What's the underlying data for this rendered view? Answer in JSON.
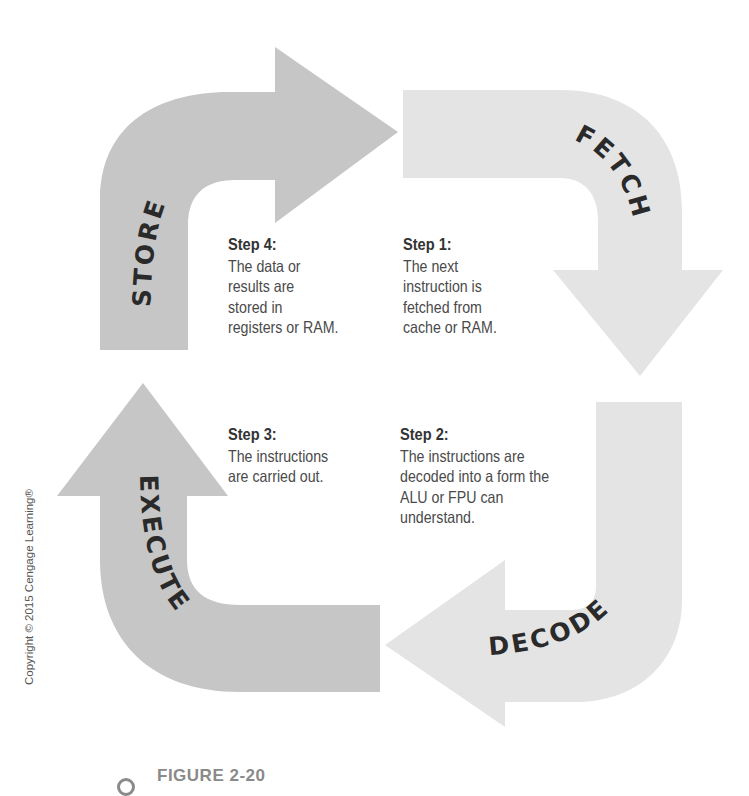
{
  "figure": {
    "caption": "FIGURE 2-20",
    "copyright": "Copyright © 2015 Cengage Learning®",
    "colors": {
      "dark_arrow": "#c6c6c6",
      "light_arrow": "#e4e4e4",
      "label_text": "#2a2a2a",
      "body_text": "#4a4a4a",
      "caption_text": "#8a8a8a"
    }
  },
  "cycle": {
    "arrows": [
      {
        "id": "fetch",
        "label": "FETCH",
        "shade": "light",
        "direction": "down"
      },
      {
        "id": "decode",
        "label": "DECODE",
        "shade": "light",
        "direction": "left"
      },
      {
        "id": "execute",
        "label": "EXECUTE",
        "shade": "dark",
        "direction": "up"
      },
      {
        "id": "store",
        "label": "STORE",
        "shade": "dark",
        "direction": "right"
      }
    ],
    "steps": [
      {
        "title": "Step 1:",
        "text": "The next\ninstruction is\nfetched from\ncache or RAM."
      },
      {
        "title": "Step 2:",
        "text": "The instructions are\ndecoded into a form the\nALU or FPU can\nunderstand."
      },
      {
        "title": "Step 3:",
        "text": "The instructions\nare carried out."
      },
      {
        "title": "Step 4:",
        "text": "The data or\nresults are\nstored in\nregisters or RAM."
      }
    ]
  }
}
